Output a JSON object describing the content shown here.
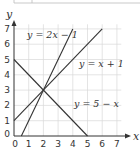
{
  "chart_data": {
    "type": "line",
    "title": "",
    "xlabel": "x",
    "ylabel": "y",
    "xlim": [
      0,
      7
    ],
    "ylim": [
      0,
      7
    ],
    "grid": true,
    "x_ticks": [
      "0",
      "1",
      "2",
      "3",
      "4",
      "5",
      "6",
      "7"
    ],
    "y_ticks": [
      "0",
      "1",
      "2",
      "3",
      "4",
      "5",
      "6",
      "7"
    ],
    "series": [
      {
        "name": "y = 2x − 1",
        "x": [
          0.5,
          4
        ],
        "y": [
          0,
          7
        ]
      },
      {
        "name": "y = x + 1",
        "x": [
          0,
          6
        ],
        "y": [
          1,
          7
        ]
      },
      {
        "name": "y = 5 − x",
        "x": [
          0,
          5
        ],
        "y": [
          5,
          0
        ]
      }
    ],
    "annotations": [
      {
        "text": "y = 2x − 1",
        "x": 1.0,
        "y": 6.8
      },
      {
        "text": "y = x + 1",
        "x": 4.5,
        "y": 4.6
      },
      {
        "text": "y = 5 − x",
        "x": 4.2,
        "y": 2.1
      }
    ],
    "intersection": {
      "x": 2,
      "y": 3
    },
    "legend": "none (inline labels)"
  },
  "labels": {
    "x_axis": "x",
    "y_axis": "y",
    "eq1": "y = 2x − 1",
    "eq2": "y = x + 1",
    "eq3": "y = 5 − x",
    "ticks": [
      "0",
      "1",
      "2",
      "3",
      "4",
      "5",
      "6",
      "7"
    ]
  }
}
